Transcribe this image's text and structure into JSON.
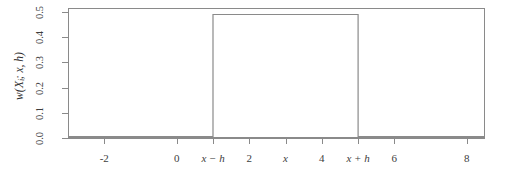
{
  "chart_data": {
    "type": "line",
    "title": "",
    "subtitle": "",
    "xlabel": "",
    "ylabel": "w(Xi; x, h)",
    "ylabel_plain": "w(X_i; x, h)",
    "xlim": [
      -3,
      8.5
    ],
    "ylim": [
      0.0,
      0.5
    ],
    "grid": false,
    "legend": null,
    "legend_position": "none",
    "line_color": "#8a8a8a",
    "background_color": "#ffffff",
    "axis_color": "#8a8a8a",
    "text_color": "#3d3d3d",
    "x_ticks": [
      {
        "value": -2,
        "label": "-2",
        "italic": false
      },
      {
        "value": 0,
        "label": "0",
        "italic": false
      },
      {
        "value": 1,
        "label": "x − h",
        "italic": true
      },
      {
        "value": 2,
        "label": "2",
        "italic": false
      },
      {
        "value": 3,
        "label": "x",
        "italic": true
      },
      {
        "value": 4,
        "label": "4",
        "italic": false
      },
      {
        "value": 5,
        "label": "x + h",
        "italic": true
      },
      {
        "value": 6,
        "label": "6",
        "italic": false
      },
      {
        "value": 8,
        "label": "8",
        "italic": false
      }
    ],
    "y_ticks": [
      {
        "value": 0.0,
        "label": "0.0"
      },
      {
        "value": 0.1,
        "label": "0.1"
      },
      {
        "value": 0.2,
        "label": "0.2"
      },
      {
        "value": 0.3,
        "label": "0.3"
      },
      {
        "value": 0.4,
        "label": "0.4"
      },
      {
        "value": 0.5,
        "label": "0.5"
      }
    ],
    "series": [
      {
        "name": "w(Xi; x, h)",
        "x": [
          -3,
          1,
          1,
          5,
          5,
          8.5
        ],
        "values": [
          0.005,
          0.005,
          0.49,
          0.49,
          0.005,
          0.005
        ]
      }
    ],
    "annotations": [
      {
        "text": "x − h",
        "x": 1,
        "note": "left edge of kernel window"
      },
      {
        "text": "x",
        "x": 3,
        "note": "center of kernel window"
      },
      {
        "text": "x + h",
        "x": 5,
        "note": "right edge of kernel window"
      }
    ],
    "plateau_value": 0.49,
    "baseline_value": 0.005
  }
}
